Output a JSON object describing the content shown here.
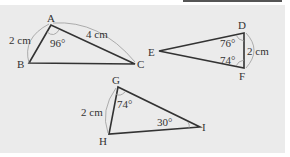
{
  "figure": {
    "triangles": [
      {
        "name": "ABC",
        "vertices": {
          "A": [
            51,
            25
          ],
          "B": [
            29,
            63
          ],
          "C": [
            135,
            64
          ]
        },
        "labels": {
          "A": "A",
          "B": "B",
          "C": "C"
        },
        "side_AB": "2 cm",
        "side_AC": "4 cm",
        "angle_A": "96°"
      },
      {
        "name": "DEF",
        "vertices": {
          "D": [
            244,
            33
          ],
          "E": [
            159,
            51
          ],
          "F": [
            244,
            68
          ]
        },
        "labels": {
          "D": "D",
          "E": "E",
          "F": "F"
        },
        "side_DF": "2 cm",
        "angle_D": "76°",
        "angle_F": "74°"
      },
      {
        "name": "GHI",
        "vertices": {
          "G": [
            118,
            87
          ],
          "H": [
            109,
            134
          ],
          "I": [
            200,
            127
          ]
        },
        "labels": {
          "G": "G",
          "H": "H",
          "I": "I"
        },
        "side_GH": "2 cm",
        "angle_G": "74°",
        "angle_I": "30°"
      }
    ],
    "colors": {
      "background": "#ebebeb",
      "line": "#333333",
      "arc": "#9a9a9a"
    }
  }
}
